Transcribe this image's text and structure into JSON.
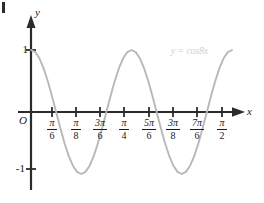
{
  "figure": {
    "background_color": "#ffffff",
    "axis_color": "#2b2b2b",
    "curve_color": "#b8b8b8",
    "label_color": "#1a1a1a",
    "annotation_color": "#cfcfcf",
    "corner_mark": ""
  },
  "axes": {
    "y_label": "y",
    "x_label": "x",
    "origin_label": "O",
    "y_tick_labels": [
      "1",
      "-1"
    ]
  },
  "x_ticks": [
    {
      "num": "π",
      "den": "6"
    },
    {
      "num": "π",
      "den": "8"
    },
    {
      "num": "3π",
      "den": "6"
    },
    {
      "num": "π",
      "den": "4"
    },
    {
      "num": "5π",
      "den": "6"
    },
    {
      "num": "3π",
      "den": "8"
    },
    {
      "num": "7π",
      "den": "6"
    },
    {
      "num": "π",
      "den": "2"
    }
  ],
  "annotation": {
    "curve_equation": "y = cos8x"
  },
  "chart_data": {
    "type": "line",
    "title": "",
    "xlabel": "x",
    "ylabel": "y",
    "series": [
      {
        "name": "y = cos8x",
        "color": "#b8b8b8",
        "points": [
          {
            "x": 0.0,
            "y": 1.0
          },
          {
            "x": 0.0327,
            "y": 0.966
          },
          {
            "x": 0.0654,
            "y": 0.866
          },
          {
            "x": 0.0982,
            "y": 0.707
          },
          {
            "x": 0.1309,
            "y": 0.5
          },
          {
            "x": 0.1636,
            "y": 0.259
          },
          {
            "x": 0.1963,
            "y": 0.0
          },
          {
            "x": 0.2291,
            "y": -0.259
          },
          {
            "x": 0.2618,
            "y": -0.5
          },
          {
            "x": 0.2945,
            "y": -0.707
          },
          {
            "x": 0.3272,
            "y": -0.866
          },
          {
            "x": 0.36,
            "y": -0.966
          },
          {
            "x": 0.3927,
            "y": -1.0
          },
          {
            "x": 0.4254,
            "y": -0.966
          },
          {
            "x": 0.4581,
            "y": -0.866
          },
          {
            "x": 0.4909,
            "y": -0.707
          },
          {
            "x": 0.5236,
            "y": -0.5
          },
          {
            "x": 0.5563,
            "y": -0.259
          },
          {
            "x": 0.589,
            "y": 0.0
          },
          {
            "x": 0.6218,
            "y": 0.259
          },
          {
            "x": 0.6545,
            "y": 0.5
          },
          {
            "x": 0.6872,
            "y": 0.707
          },
          {
            "x": 0.7199,
            "y": 0.866
          },
          {
            "x": 0.7527,
            "y": 0.966
          },
          {
            "x": 0.7854,
            "y": 1.0
          },
          {
            "x": 0.8181,
            "y": 0.966
          },
          {
            "x": 0.8508,
            "y": 0.866
          },
          {
            "x": 0.8836,
            "y": 0.707
          },
          {
            "x": 0.9163,
            "y": 0.5
          },
          {
            "x": 0.949,
            "y": 0.259
          },
          {
            "x": 0.9817,
            "y": 0.0
          },
          {
            "x": 1.0145,
            "y": -0.259
          },
          {
            "x": 1.0472,
            "y": -0.5
          },
          {
            "x": 1.0799,
            "y": -0.707
          },
          {
            "x": 1.1126,
            "y": -0.866
          },
          {
            "x": 1.1454,
            "y": -0.966
          },
          {
            "x": 1.1781,
            "y": -1.0
          },
          {
            "x": 1.2108,
            "y": -0.966
          },
          {
            "x": 1.2435,
            "y": -0.866
          },
          {
            "x": 1.2763,
            "y": -0.707
          },
          {
            "x": 1.309,
            "y": -0.5
          },
          {
            "x": 1.3417,
            "y": -0.259
          },
          {
            "x": 1.3744,
            "y": 0.0
          },
          {
            "x": 1.4072,
            "y": 0.259
          },
          {
            "x": 1.4399,
            "y": 0.5
          },
          {
            "x": 1.4726,
            "y": 0.707
          },
          {
            "x": 1.5053,
            "y": 0.866
          },
          {
            "x": 1.5381,
            "y": 0.966
          },
          {
            "x": 1.5708,
            "y": 1.0
          }
        ]
      }
    ],
    "xlim": [
      0,
      1.5708
    ],
    "ylim": [
      -1,
      1
    ],
    "grid": false,
    "legend": "none",
    "annotations": [
      "y = cos8x"
    ],
    "x_tick_values": [
      0.5236,
      0.3927,
      1.5708,
      0.7854,
      2.618,
      1.1781,
      3.665,
      1.5708
    ],
    "x_tick_labels": [
      "π/6",
      "π/8",
      "3π/6",
      "π/4",
      "5π/6",
      "3π/8",
      "7π/6",
      "π/2"
    ],
    "y_tick_values": [
      1,
      -1
    ],
    "y_tick_labels": [
      "1",
      "-1"
    ]
  }
}
